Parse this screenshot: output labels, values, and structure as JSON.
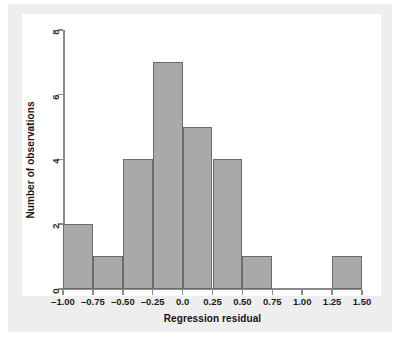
{
  "figure": {
    "background": "#eeeeee",
    "panel_background": "#ffffff",
    "bar_fill": "#a9a9a9",
    "bar_stroke": "#6b6b6b",
    "axis_color": "#8a8a8a"
  },
  "chart_data": {
    "type": "bar",
    "title": "",
    "xlabel": "Regression residual",
    "ylabel": "Number of observations",
    "xlim": [
      -1.0,
      1.5
    ],
    "ylim": [
      0,
      8
    ],
    "grid": false,
    "legend": "none",
    "bin_width": 0.25,
    "xticks": [
      -1.0,
      -0.75,
      -0.5,
      -0.25,
      0.0,
      0.25,
      0.5,
      0.75,
      1.0,
      1.25,
      1.5
    ],
    "xtick_labels": [
      "–1.00",
      "–0.75",
      "–0.50",
      "–0.25",
      "0.0",
      "0.25",
      "0.50",
      "0.75",
      "1.00",
      "1.25",
      "1.50"
    ],
    "yticks": [
      0,
      2,
      4,
      6,
      8
    ],
    "ytick_labels": [
      "0",
      "2",
      "4",
      "6",
      "8"
    ],
    "bins": [
      {
        "left": -1.0,
        "right": -0.75,
        "label": "–1.00 to –0.75",
        "count": 2
      },
      {
        "left": -0.75,
        "right": -0.5,
        "label": "–0.75 to –0.50",
        "count": 1
      },
      {
        "left": -0.5,
        "right": -0.25,
        "label": "–0.50 to –0.25",
        "count": 4
      },
      {
        "left": -0.25,
        "right": 0.0,
        "label": "–0.25 to 0.00",
        "count": 7
      },
      {
        "left": 0.0,
        "right": 0.25,
        "label": "0.00 to 0.25",
        "count": 5
      },
      {
        "left": 0.25,
        "right": 0.5,
        "label": "0.25 to 0.50",
        "count": 4
      },
      {
        "left": 0.5,
        "right": 0.75,
        "label": "0.50 to 0.75",
        "count": 1
      },
      {
        "left": 0.75,
        "right": 1.0,
        "label": "0.75 to 1.00",
        "count": 0
      },
      {
        "left": 1.0,
        "right": 1.25,
        "label": "1.00 to 1.25",
        "count": 0
      },
      {
        "left": 1.25,
        "right": 1.5,
        "label": "1.25 to 1.50",
        "count": 1
      }
    ],
    "categories": [
      "–1.00",
      "–0.75",
      "–0.50",
      "–0.25",
      "0.00",
      "0.25",
      "0.50",
      "0.75",
      "1.00",
      "1.25"
    ],
    "values": [
      2,
      1,
      4,
      7,
      5,
      4,
      1,
      0,
      0,
      1
    ],
    "total_observations": 25
  }
}
